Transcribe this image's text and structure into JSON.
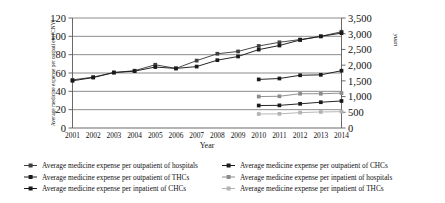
{
  "chart_data": {
    "type": "line",
    "title": "",
    "xlabel": "Year",
    "ylabel": "Average medicine expense per outpati ent (CNY)",
    "y2label": "yuan",
    "grid": true,
    "legend_position": "bottom",
    "ylim": [
      0,
      120
    ],
    "y2lim": [
      0,
      3500
    ],
    "yticks": [
      "0",
      "20",
      "40",
      "60",
      "80",
      "100",
      "120"
    ],
    "y2ticks": [
      "0",
      "500",
      "1,000",
      "1,500",
      "2,000",
      "2,500",
      "3,000",
      "3,500"
    ],
    "categories": [
      "2001",
      "2002",
      "2003",
      "2004",
      "2005",
      "2006",
      "2007",
      "2008",
      "2009",
      "2010",
      "2011",
      "2012",
      "2013",
      "2014"
    ],
    "series": [
      {
        "name": "Average medicine expense per outpatient of hospitals",
        "axis": "left",
        "color": "#3f3f3f",
        "marker": "square",
        "values": [
          52.5,
          55.5,
          60.5,
          62.5,
          69.0,
          65.0,
          73.5,
          81.0,
          83.5,
          89.5,
          93.5,
          96.5,
          100.0,
          105.0
        ]
      },
      {
        "name": "Average medicine expense per outpatient of CHCs",
        "axis": "left",
        "color": "#1a1a1a",
        "marker": "diamond",
        "values": [
          51.5,
          55.0,
          60.5,
          62.0,
          66.5,
          65.0,
          67.0,
          74.0,
          78.0,
          85.5,
          90.0,
          96.0,
          100.0,
          103.5
        ]
      },
      {
        "name": "Average medicine expense per outpatient of THCs",
        "axis": "left",
        "color": "#1a1a1a",
        "marker": "circle",
        "values": [
          null,
          null,
          null,
          null,
          null,
          null,
          null,
          null,
          null,
          53.0,
          54.0,
          57.5,
          58.0,
          62.5
        ]
      },
      {
        "name": "Average medicine expense per inpatient of hospitals",
        "axis": "right",
        "color": "#8c8c8c",
        "marker": "square",
        "values": [
          null,
          null,
          null,
          null,
          null,
          null,
          null,
          null,
          null,
          1000,
          1010,
          1090,
          1090,
          1110
        ]
      },
      {
        "name": "Average medicine expense per inpatient of CHCs",
        "axis": "right",
        "color": "#1a1a1a",
        "marker": "circle",
        "values": [
          null,
          null,
          null,
          null,
          null,
          null,
          null,
          null,
          null,
          715,
          720,
          770,
          820,
          860
        ]
      },
      {
        "name": "Average medicine expense per inpatient of THCs",
        "axis": "right",
        "color": "#b3b3b3",
        "marker": "square",
        "values": [
          null,
          null,
          null,
          null,
          null,
          null,
          null,
          null,
          null,
          445,
          450,
          490,
          510,
          520
        ]
      }
    ],
    "legend": [
      {
        "label": "Average medicine expense per outpatient of hospitals",
        "color": "#3f3f3f",
        "marker": "square",
        "column": 0
      },
      {
        "label": "Average medicine expense per outpatient of CHCs",
        "color": "#1a1a1a",
        "marker": "square",
        "column": 1
      },
      {
        "label": "Average medicine expense per outpatient of THCs",
        "color": "#1a1a1a",
        "marker": "square",
        "column": 0
      },
      {
        "label": "Average medicine expense per inpatient of hospitals",
        "color": "#8c8c8c",
        "marker": "square",
        "column": 1
      },
      {
        "label": "Average medicine expense per inpatient of CHCs",
        "color": "#1a1a1a",
        "marker": "square",
        "column": 0
      },
      {
        "label": "Average medicine expense per inpatient of THCs",
        "color": "#b3b3b3",
        "marker": "square",
        "column": 1
      }
    ]
  }
}
